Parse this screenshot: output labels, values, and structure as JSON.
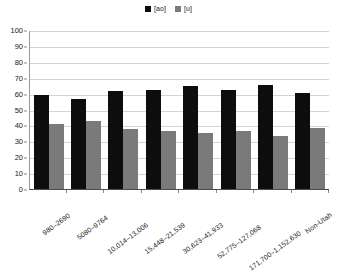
{
  "chart_data": {
    "type": "bar",
    "title": "",
    "subtitle": "",
    "xlabel": "",
    "ylabel": "",
    "ylim": [
      0,
      100
    ],
    "ytick_step": 10,
    "yticks": [
      "100",
      "90",
      "80",
      "70",
      "60",
      "50",
      "40",
      "30",
      "20",
      "10",
      "0"
    ],
    "grid": true,
    "legend_position": "top-center",
    "categories": [
      "980–2690",
      "5080–9764",
      "10,014–13,006",
      "15,448–21,539",
      "30,623–41,933",
      "52,775–127,068",
      "171,700–1,152,630",
      "Non-Utah"
    ],
    "series": [
      {
        "name": "[ao]",
        "color": "#0d0d0d",
        "values": [
          59,
          56.5,
          61.5,
          62.5,
          64.5,
          62.5,
          65.5,
          60.5
        ]
      },
      {
        "name": "[u]",
        "color": "#7a7a7a",
        "values": [
          41,
          42.5,
          38,
          36.5,
          35,
          36.5,
          33.5,
          38.5
        ]
      }
    ]
  },
  "legend": {
    "entries": [
      {
        "label": "[ao]",
        "swatch": "legend-swatch-ao"
      },
      {
        "label": "[u]",
        "swatch": "legend-swatch-u"
      }
    ]
  }
}
